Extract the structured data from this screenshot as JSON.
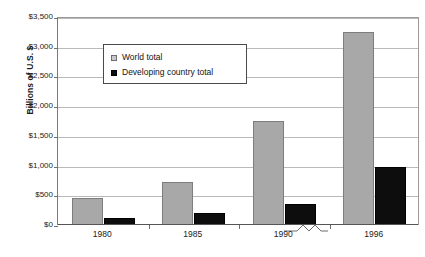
{
  "chart_data": {
    "type": "bar",
    "title": "",
    "xlabel": "",
    "ylabel": "Billions of U.S. $",
    "categories": [
      "1980",
      "1985",
      "1990",
      "1996"
    ],
    "series": [
      {
        "name": "World total",
        "color": "#a8a8a8",
        "values": [
          450,
          730,
          1750,
          3250
        ]
      },
      {
        "name": "Developing country total",
        "color": "#0d0d0d",
        "values": [
          110,
          200,
          350,
          975
        ]
      }
    ],
    "ylim": [
      0,
      3500
    ],
    "yticks": [
      0,
      500,
      1000,
      1500,
      2000,
      2500,
      3000,
      3500
    ],
    "ytick_labels": [
      "$0",
      "$500",
      "$1,000",
      "$1,500",
      "$2,000",
      "$2,500",
      "$3,000",
      "$3,500"
    ],
    "grid": true,
    "legend_position": "upper-left-inside",
    "axis_break": {
      "present": true,
      "between": [
        "1990",
        "1996"
      ],
      "symbol": "zigzag"
    }
  },
  "legend": {
    "items": [
      {
        "label": "World total",
        "swatch": "world-swatch"
      },
      {
        "label": "Developing country total",
        "swatch": "developing-swatch"
      }
    ]
  },
  "axes": {
    "y_title": "Billions of U.S. $"
  },
  "title_sliver": {
    "text": ""
  }
}
